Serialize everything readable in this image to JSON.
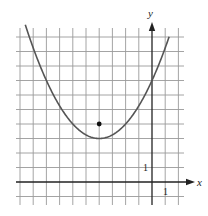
{
  "chart_data": {
    "type": "line",
    "title": "",
    "xlabel": "x",
    "ylabel": "y",
    "xlim": [
      -10,
      2
    ],
    "ylim": [
      -1,
      10
    ],
    "grid": true,
    "grid_step": 1,
    "tick_labels": {
      "x": [
        "1"
      ],
      "y": [
        "1"
      ]
    },
    "series": [
      {
        "name": "parabola",
        "equation": "y = 0.25(x + 4)^2 + 3",
        "vertex": [
          -4,
          3
        ],
        "y_intercept": 7,
        "x": [
          -9.6,
          -9,
          -8,
          -7,
          -6,
          -5,
          -4,
          -3,
          -2,
          -1,
          0,
          1,
          1.3
        ],
        "values": [
          10.84,
          9.25,
          7,
          5.25,
          4,
          3.25,
          3,
          3.25,
          4,
          5.25,
          7,
          9.25,
          10.02
        ]
      }
    ],
    "points": [
      {
        "name": "focus-point",
        "x": -4,
        "y": 4
      }
    ]
  },
  "axes": {
    "x_label": "x",
    "y_label": "y",
    "x_unit_label": "1",
    "y_unit_label": "1"
  },
  "colors": {
    "grid": "#9a9a9a",
    "axis": "#222222",
    "curve": "#555555",
    "point": "#111111"
  }
}
